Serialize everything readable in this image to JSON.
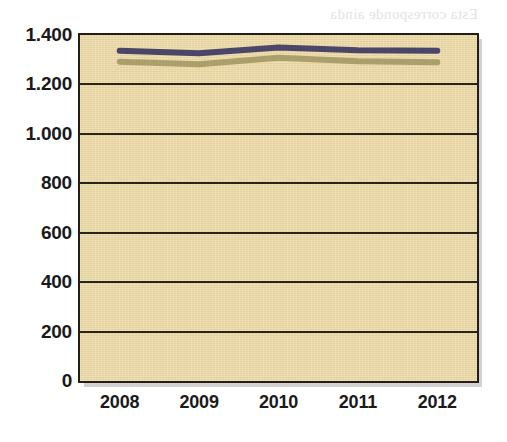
{
  "chart_data": {
    "type": "line",
    "title": "",
    "subtitle": "",
    "xlabel": "",
    "ylabel": "",
    "categories": [
      "2008",
      "2009",
      "2010",
      "2011",
      "2012"
    ],
    "ylim": [
      0,
      1400
    ],
    "yticks": [
      "0",
      "200",
      "400",
      "600",
      "800",
      "1.000",
      "1.200",
      "1.400"
    ],
    "ytick_values": [
      0,
      200,
      400,
      600,
      800,
      1000,
      1200,
      1400
    ],
    "grid": true,
    "grid_axis": "y",
    "legend": "none",
    "series": [
      {
        "name": "series-1",
        "color": "#403a63",
        "values": [
          1336,
          1326,
          1350,
          1338,
          1336
        ]
      },
      {
        "name": "series-2",
        "color": "#a69a66",
        "values": [
          1292,
          1282,
          1308,
          1294,
          1290
        ]
      }
    ]
  },
  "plot": {
    "background_color": "#ecd9a4",
    "border_color": "#231f18",
    "gridline_color": "#2a241a",
    "shadow_color": "#c9c9c9"
  },
  "page_background": {
    "bleed_text": [
      "Esta corresponde ainda",
      "a revisão dos recursos",
      "rendidos",
      "A exan proposta",
      "de meio dos que",
      "favoravel ha importante",
      "com as pequenas",
      "um dos perguntas",
      "de todos por essa"
    ]
  }
}
